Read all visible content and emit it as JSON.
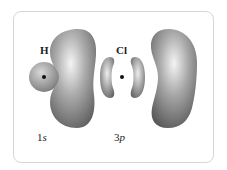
{
  "diagram": {
    "atoms": [
      {
        "symbol": "H",
        "orbital_number": "1",
        "orbital_letter": "s"
      },
      {
        "symbol": "Cl",
        "orbital_number": "3",
        "orbital_letter": "p"
      }
    ],
    "colors": {
      "lobe_dark": "#5a5a5a",
      "lobe_light": "#f2f2f2",
      "sphere": "#8a8a8a",
      "nucleus": "#111111",
      "frame": "#d6d6d6"
    }
  }
}
